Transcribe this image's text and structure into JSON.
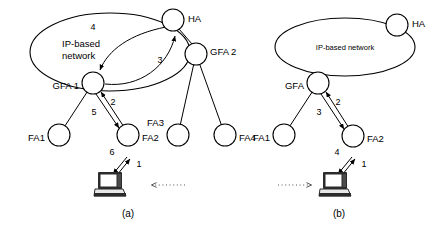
{
  "figure": {
    "width": 448,
    "height": 227,
    "background": "#ffffff",
    "stroke": "#000000"
  },
  "panels": [
    {
      "id": "a",
      "caption": "(a)",
      "caption_pos": {
        "x": 128,
        "y": 217
      },
      "cloud": {
        "label_line1": "IP-based",
        "label_line2": "network",
        "cx": 110,
        "cy": 52,
        "rx": 80,
        "ry": 39,
        "label_x": 62,
        "label_y": 47
      },
      "nodes": [
        {
          "name": "HA",
          "label": "HA",
          "cx": 173,
          "cy": 20,
          "r": 11,
          "label_x": 188,
          "label_y": 19,
          "anchor": "start"
        },
        {
          "name": "GFA1",
          "label": "GFA 1",
          "cx": 93,
          "cy": 83,
          "r": 11,
          "label_x": 79,
          "label_y": 86,
          "anchor": "end"
        },
        {
          "name": "GFA2",
          "label": "GFA 2",
          "cx": 196,
          "cy": 54,
          "r": 11,
          "label_x": 210,
          "label_y": 52,
          "anchor": "start"
        },
        {
          "name": "FA1",
          "label": "FA1",
          "cx": 59,
          "cy": 135,
          "r": 11,
          "label_x": 45,
          "label_y": 138,
          "anchor": "end"
        },
        {
          "name": "FA2",
          "label": "FA2",
          "cx": 128,
          "cy": 135,
          "r": 11,
          "label_x": 142,
          "label_y": 138,
          "anchor": "start"
        },
        {
          "name": "FA3",
          "label": "FA3",
          "cx": 178,
          "cy": 135,
          "r": 11,
          "label_x": 164,
          "label_y": 123,
          "anchor": "end"
        },
        {
          "name": "FA4",
          "label": "FA4",
          "cx": 225,
          "cy": 135,
          "r": 11,
          "label_x": 239,
          "label_y": 138,
          "anchor": "start"
        }
      ],
      "links": [
        {
          "from": "GFA1",
          "to": "FA1"
        },
        {
          "from": "GFA2",
          "to": "FA3"
        },
        {
          "from": "GFA2",
          "to": "FA4"
        },
        {
          "from": "HA",
          "to": "GFA2"
        }
      ],
      "steps": [
        {
          "num": "1",
          "x": 139,
          "y": 167
        },
        {
          "num": "2",
          "x": 113,
          "y": 105
        },
        {
          "num": "3",
          "x": 160,
          "y": 63
        },
        {
          "num": "4",
          "x": 93,
          "y": 30
        },
        {
          "num": "5",
          "x": 94,
          "y": 115
        },
        {
          "num": "6",
          "x": 112,
          "y": 155
        }
      ],
      "laptop": {
        "x": 110,
        "y": 185
      },
      "dotted_arrow": {
        "x1": 185,
        "y1": 185,
        "x2": 152,
        "y2": 185,
        "direction": "left"
      }
    },
    {
      "id": "b",
      "caption": "(b)",
      "caption_pos": {
        "x": 339,
        "y": 217
      },
      "cloud": {
        "label_line1": "IP-based network",
        "label_line2": "",
        "cx": 345,
        "cy": 47,
        "rx": 70,
        "ry": 29,
        "label_x": 345,
        "label_y": 50
      },
      "nodes": [
        {
          "name": "HA",
          "label": "HA",
          "cx": 397,
          "cy": 25,
          "r": 11,
          "label_x": 412,
          "label_y": 24,
          "anchor": "start"
        },
        {
          "name": "GFA",
          "label": "GFA",
          "cx": 318,
          "cy": 83,
          "r": 11,
          "label_x": 304,
          "label_y": 86,
          "anchor": "end"
        },
        {
          "name": "FA1",
          "label": "FA1",
          "cx": 284,
          "cy": 135,
          "r": 11,
          "label_x": 270,
          "label_y": 138,
          "anchor": "end"
        },
        {
          "name": "FA2",
          "label": "FA2",
          "cx": 353,
          "cy": 136,
          "r": 11,
          "label_x": 367,
          "label_y": 139,
          "anchor": "start"
        }
      ],
      "links": [
        {
          "from": "GFA",
          "to": "FA1"
        }
      ],
      "steps": [
        {
          "num": "1",
          "x": 364,
          "y": 167
        },
        {
          "num": "2",
          "x": 338,
          "y": 105
        },
        {
          "num": "3",
          "x": 319,
          "y": 115
        },
        {
          "num": "4",
          "x": 337,
          "y": 155
        }
      ],
      "laptop": {
        "x": 335,
        "y": 185
      },
      "dotted_arrow": {
        "x1": 278,
        "y1": 185,
        "x2": 311,
        "y2": 185,
        "direction": "right"
      }
    }
  ]
}
